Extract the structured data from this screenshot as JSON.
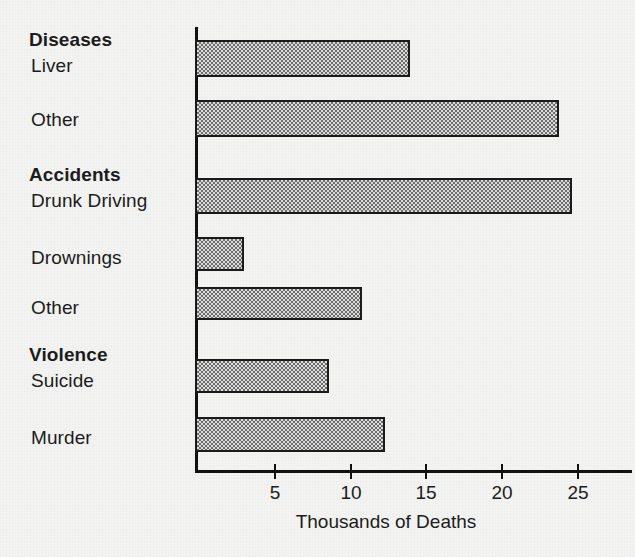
{
  "chart_data": {
    "type": "bar",
    "orientation": "horizontal",
    "title": "",
    "xlabel": "Thousands of Deaths",
    "ylabel": "",
    "xlim": [
      0,
      27.5
    ],
    "xticks": [
      "5",
      "10",
      "15",
      "20",
      "25"
    ],
    "xtick_values": [
      5,
      10,
      15,
      20,
      25
    ],
    "grid": false,
    "legend": "none",
    "groups": [
      {
        "name": "Diseases",
        "items": [
          {
            "label": "Liver",
            "value": 14.0
          },
          {
            "label": "Other",
            "value": 23.8
          }
        ]
      },
      {
        "name": "Accidents",
        "items": [
          {
            "label": "Drunk Driving",
            "value": 24.7
          },
          {
            "label": "Drownings",
            "value": 3.0
          },
          {
            "label": "Other",
            "value": 10.8
          }
        ]
      },
      {
        "name": "Violence",
        "items": [
          {
            "label": "Suicide",
            "value": 8.6
          },
          {
            "label": "Murder",
            "value": 12.3
          }
        ]
      }
    ],
    "categories": [
      "Liver",
      "Other",
      "Drunk Driving",
      "Drownings",
      "Other",
      "Suicide",
      "Murder"
    ],
    "values": [
      14.0,
      23.8,
      24.7,
      3.0,
      10.8,
      8.6,
      12.3
    ]
  },
  "labels": {
    "group_diseases": "Diseases",
    "item_liver": "Liver",
    "item_disease_other": "Other",
    "group_accidents": "Accidents",
    "item_drunk_driving": "Drunk Driving",
    "item_drownings": "Drownings",
    "item_accident_other": "Other",
    "group_violence": "Violence",
    "item_suicide": "Suicide",
    "item_murder": "Murder"
  },
  "axis": {
    "tick_5": "5",
    "tick_10": "10",
    "tick_15": "15",
    "tick_20": "20",
    "tick_25": "25",
    "title": "Thousands of Deaths"
  },
  "colors": {
    "background": "#f3f3f1",
    "axis": "#111111",
    "bar_border": "#1a1a1a",
    "bar_fill_dark": "#6e6e6e",
    "bar_fill_light": "#dcdcdc",
    "text": "#1c1c1c"
  }
}
